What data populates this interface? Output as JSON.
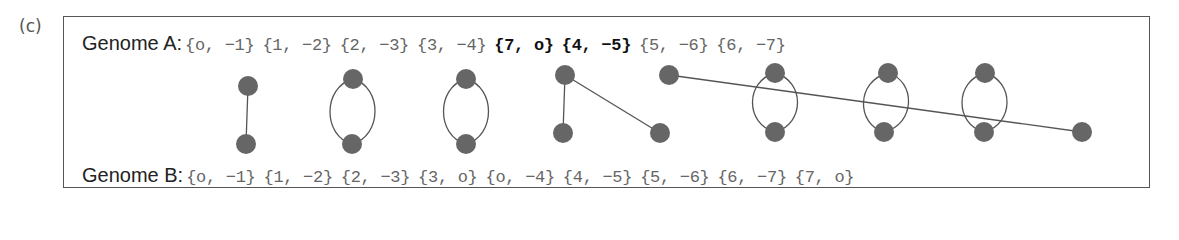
{
  "panel_label": "(c)",
  "genome_a": {
    "label": "Genome A:",
    "pairs": [
      {
        "text": "{o, −1}",
        "bold": false
      },
      {
        "text": "{1, −2}",
        "bold": false
      },
      {
        "text": "{2, −3}",
        "bold": false
      },
      {
        "text": "{3, −4}",
        "bold": false
      },
      {
        "text": "{7, o}",
        "bold": true
      },
      {
        "text": "{4, −5}",
        "bold": true
      },
      {
        "text": "{5, −6}",
        "bold": false
      },
      {
        "text": "{6, −7}",
        "bold": false
      }
    ]
  },
  "genome_b": {
    "label": "Genome B:",
    "pairs": [
      {
        "text": "{o, −1}",
        "bold": false
      },
      {
        "text": "{1, −2}",
        "bold": false
      },
      {
        "text": "{2, −3}",
        "bold": false
      },
      {
        "text": "{3, o}",
        "bold": false
      },
      {
        "text": "{o, −4}",
        "bold": false
      },
      {
        "text": "{4, −5}",
        "bold": false
      },
      {
        "text": "{5, −6}",
        "bold": false
      },
      {
        "text": "{6, −7}",
        "bold": false
      },
      {
        "text": "{7, o}",
        "bold": false
      }
    ]
  },
  "graph": {
    "node_color": "#666666",
    "edge_color": "#555555",
    "top_nodes": [
      {
        "id": "A1",
        "x": 248,
        "y": 86
      },
      {
        "id": "A2",
        "x": 353,
        "y": 79
      },
      {
        "id": "A3",
        "x": 466,
        "y": 79
      },
      {
        "id": "A4",
        "x": 565,
        "y": 75
      },
      {
        "id": "A5",
        "x": 669,
        "y": 75
      },
      {
        "id": "A6",
        "x": 775,
        "y": 73
      },
      {
        "id": "A7",
        "x": 888,
        "y": 73
      },
      {
        "id": "A8",
        "x": 985,
        "y": 73
      }
    ],
    "bottom_nodes": [
      {
        "id": "B1",
        "x": 246,
        "y": 144
      },
      {
        "id": "B2",
        "x": 352,
        "y": 144
      },
      {
        "id": "B3",
        "x": 466,
        "y": 144
      },
      {
        "id": "B4",
        "x": 563,
        "y": 133
      },
      {
        "id": "B5",
        "x": 660,
        "y": 133
      },
      {
        "id": "B6",
        "x": 775,
        "y": 132
      },
      {
        "id": "B7",
        "x": 884,
        "y": 132
      },
      {
        "id": "B8",
        "x": 984,
        "y": 132
      },
      {
        "id": "B9",
        "x": 1082,
        "y": 132
      }
    ],
    "edges": [
      {
        "from": "A1",
        "to": "B1",
        "type": "line"
      },
      {
        "from": "A2",
        "to": "B2",
        "type": "double"
      },
      {
        "from": "A3",
        "to": "B3",
        "type": "double"
      },
      {
        "from": "A4",
        "to": "B4",
        "type": "line"
      },
      {
        "from": "A4",
        "to": "B5",
        "type": "line"
      },
      {
        "from": "A5",
        "to": "B9",
        "type": "line"
      },
      {
        "from": "A6",
        "to": "B6",
        "type": "double"
      },
      {
        "from": "A7",
        "to": "B7",
        "type": "double"
      },
      {
        "from": "A8",
        "to": "B8",
        "type": "double"
      }
    ]
  }
}
